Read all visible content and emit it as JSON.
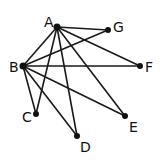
{
  "graph": {
    "nodes": [
      {
        "id": "A",
        "label": "A",
        "x": 57,
        "y": 27,
        "lx": 44,
        "ly": 27
      },
      {
        "id": "G",
        "label": "G",
        "x": 108,
        "y": 30,
        "lx": 113,
        "ly": 32
      },
      {
        "id": "B",
        "label": "B",
        "x": 23,
        "y": 66,
        "lx": 9,
        "ly": 72
      },
      {
        "id": "F",
        "label": "F",
        "x": 140,
        "y": 66,
        "lx": 145,
        "ly": 72
      },
      {
        "id": "C",
        "label": "C",
        "x": 36,
        "y": 114,
        "lx": 22,
        "ly": 122
      },
      {
        "id": "E",
        "label": "E",
        "x": 125,
        "y": 116,
        "lx": 129,
        "ly": 132
      },
      {
        "id": "D",
        "label": "D",
        "x": 77,
        "y": 136,
        "lx": 80,
        "ly": 152
      }
    ],
    "edges": [
      [
        "A",
        "G"
      ],
      [
        "A",
        "B"
      ],
      [
        "A",
        "C"
      ],
      [
        "A",
        "D"
      ],
      [
        "A",
        "E"
      ],
      [
        "A",
        "F"
      ],
      [
        "B",
        "G"
      ],
      [
        "B",
        "F"
      ],
      [
        "B",
        "C"
      ],
      [
        "B",
        "D"
      ],
      [
        "B",
        "E"
      ]
    ],
    "node_color": "#111111",
    "edge_color": "#1a1a1a"
  }
}
